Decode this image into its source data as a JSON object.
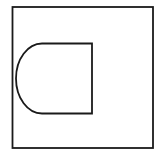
{
  "diagram": {
    "background": "#ffffff",
    "stroke_color": "#1a1a1a",
    "shapes": [
      {
        "name": "outer-square",
        "type": "rect",
        "x": 12,
        "y": 7,
        "width": 141,
        "height": 141
      },
      {
        "name": "inner-d-shape",
        "type": "path",
        "description": "rectangle with rounded left side",
        "x": 16,
        "y": 43,
        "width": 76,
        "height": 70
      }
    ]
  }
}
